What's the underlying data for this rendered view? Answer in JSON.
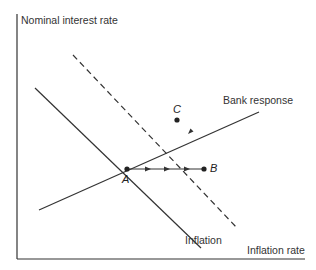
{
  "diagram": {
    "type": "economics-line-diagram",
    "axes": {
      "y_label": "Nominal interest rate",
      "x_label": "Inflation rate"
    },
    "curves": [
      {
        "name": "Bank response",
        "style": "solid",
        "label": "Bank response"
      },
      {
        "name": "Inflation",
        "style": "solid",
        "label": "Inflation"
      },
      {
        "name": "Shifted inflation",
        "style": "dashed",
        "label": ""
      }
    ],
    "points": [
      {
        "label": "A"
      },
      {
        "label": "B"
      },
      {
        "label": "C"
      }
    ],
    "paths": [
      {
        "from": "A",
        "to": "B",
        "arrowheads": 3,
        "direction": "horizontal"
      },
      {
        "from": "B",
        "to": "C",
        "arrowheads": 1,
        "direction": "along dashed line"
      }
    ],
    "colors": {
      "line": "#333333",
      "background": "#ffffff"
    }
  }
}
